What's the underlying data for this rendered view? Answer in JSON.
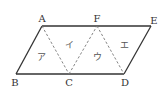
{
  "diagram": {
    "type": "parallelogram-divided-into-triangles",
    "colors": {
      "solid_edge": "#333333",
      "dashed_edge": "#777777",
      "label": "#333333",
      "region_label": "#555555"
    },
    "vertices": {
      "A": {
        "label": "A",
        "x": 42,
        "y": 26
      },
      "F": {
        "label": "F",
        "x": 97,
        "y": 26
      },
      "E": {
        "label": "E",
        "x": 151,
        "y": 26
      },
      "B": {
        "label": "B",
        "x": 16,
        "y": 74
      },
      "C": {
        "label": "C",
        "x": 69,
        "y": 74
      },
      "D": {
        "label": "D",
        "x": 124,
        "y": 74
      }
    },
    "edges": {
      "solid": [
        [
          "A",
          "E"
        ],
        [
          "E",
          "D"
        ],
        [
          "D",
          "B"
        ],
        [
          "B",
          "A"
        ]
      ],
      "dashed": [
        [
          "A",
          "C"
        ],
        [
          "C",
          "F"
        ],
        [
          "F",
          "D"
        ]
      ]
    },
    "regions": [
      {
        "label": "ア",
        "triangle": [
          "A",
          "B",
          "C"
        ]
      },
      {
        "label": "イ",
        "triangle": [
          "A",
          "C",
          "F"
        ]
      },
      {
        "label": "ウ",
        "triangle": [
          "F",
          "C",
          "D"
        ]
      },
      {
        "label": "エ",
        "triangle": [
          "F",
          "D",
          "E"
        ]
      }
    ]
  }
}
